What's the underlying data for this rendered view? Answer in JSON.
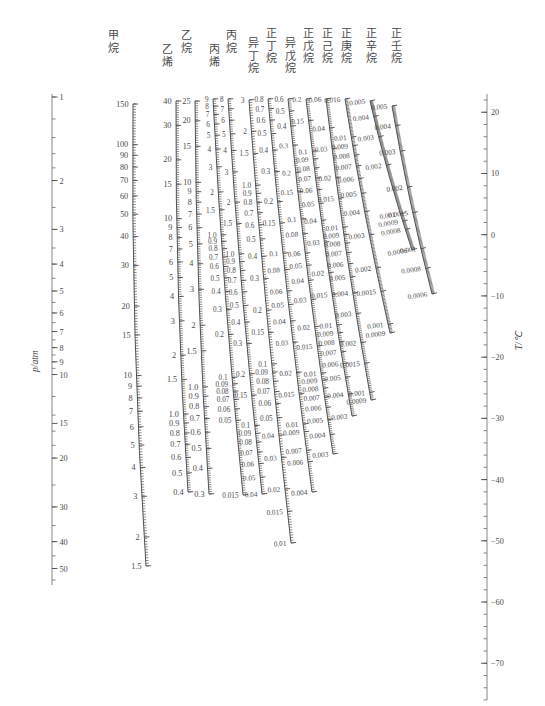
{
  "figure": {
    "kind": "nomogram",
    "left_axis": {
      "label": "p/atm",
      "ticks": [
        "1",
        "2",
        "3",
        "4",
        "5",
        "6",
        "7",
        "8",
        "9",
        "10",
        "15",
        "20",
        "30",
        "40",
        "50"
      ]
    },
    "right_axis": {
      "label": "T/℃",
      "ticks": [
        "20",
        "10",
        "0",
        "−10",
        "−20",
        "−30",
        "−40",
        "−50",
        "−60",
        "−70"
      ]
    }
  },
  "scales": [
    {
      "name": "methane",
      "label": "甲烷",
      "ticks": [
        "150",
        "100",
        "90",
        "80",
        "70",
        "60",
        "50",
        "40",
        "30",
        "20",
        "15",
        "10",
        "9",
        "8",
        "7",
        "6",
        "5",
        "4",
        "3",
        "2",
        "1.5"
      ]
    },
    {
      "name": "ethylene",
      "label": "乙烯",
      "ticks": [
        "40",
        "30",
        "20",
        "15",
        "10",
        "9",
        "8",
        "7",
        "6",
        "5",
        "4",
        "3",
        "2",
        "1.5",
        "1.0",
        "0.9",
        "0.8",
        "0.7",
        "0.6",
        "0.5",
        "0.4"
      ]
    },
    {
      "name": "ethane",
      "label": "乙烷",
      "ticks": [
        "25",
        "20",
        "15",
        "10",
        "9",
        "8",
        "7",
        "6",
        "5",
        "4",
        "3",
        "2",
        "1.5",
        "1.0",
        "0.9",
        "0.8",
        "0.7",
        "0.6",
        "0.5",
        "0.4",
        "0.3"
      ]
    },
    {
      "name": "propylene",
      "label": "丙烯",
      "ticks": [
        "9",
        "8",
        "7",
        "6",
        "5",
        "4",
        "3",
        "2",
        "1.5",
        "1.0",
        "0.9",
        "0.8",
        "0.7",
        "0.6",
        "0.5",
        "0.4",
        "0.3",
        "0.2",
        "0.1",
        "0.09",
        "0.08",
        "0.07",
        "0.06",
        "0.05",
        "0.015"
      ]
    },
    {
      "name": "propane",
      "label": "丙烷",
      "ticks": [
        "8",
        "7",
        "6",
        "5",
        "4",
        "3",
        "2",
        "1.5",
        "1.0",
        "0.9",
        "0.8",
        "0.7",
        "0.6",
        "0.5",
        "0.4",
        "0.3",
        "0.2",
        "0.15",
        "0.1",
        "0.09",
        "0.08",
        "0.07",
        "0.06",
        "0.05",
        "0.04"
      ]
    },
    {
      "name": "isobutane",
      "label": "异丁烷",
      "ticks": [
        "3",
        "2",
        "1.5",
        "1.0",
        "0.9",
        "0.8",
        "0.7",
        "0.6",
        "0.5",
        "0.4",
        "0.3",
        "0.2",
        "0.15",
        "0.1",
        "0.09",
        "0.08",
        "0.07",
        "0.06",
        "0.05",
        "0.04",
        "0.03",
        "0.02",
        "0.015",
        "0.01"
      ]
    },
    {
      "name": "n-butane",
      "label": "正丁烷",
      "ticks": [
        "0.8",
        "0.7",
        "0.6",
        "0.5",
        "0.4",
        "0.3",
        "0.2",
        "0.15",
        "0.1",
        "0.08",
        "0.06",
        "0.05",
        "0.04",
        "0.03",
        "0.02",
        "0.015",
        "0.01",
        "0.009",
        "0.007",
        "0.006",
        "0.004"
      ]
    },
    {
      "name": "isopentane",
      "label": "异戊烷",
      "ticks": [
        "0.6",
        "0.5",
        "0.4",
        "0.3",
        "0.2",
        "0.15",
        "0.1",
        "0.08",
        "0.06",
        "0.05",
        "0.04",
        "0.03",
        "0.02",
        "0.015",
        "0.01",
        "0.009",
        "0.008",
        "0.007",
        "0.006",
        "0.005",
        "0.004",
        "0.003"
      ]
    },
    {
      "name": "n-pentane",
      "label": "正戊烷",
      "ticks": [
        "0.2",
        "0.15",
        "0.1",
        "0.09",
        "0.08",
        "0.07",
        "0.06",
        "0.05",
        "0.04",
        "0.03",
        "0.02",
        "0.015",
        "0.01",
        "0.009",
        "0.008",
        "0.007",
        "0.006",
        "0.005",
        "0.004",
        "0.003"
      ]
    },
    {
      "name": "n-hexane",
      "label": "正己烷",
      "ticks": [
        "0.06",
        "0.04",
        "0.03",
        "0.02",
        "0.015",
        "0.01",
        "0.009",
        "0.008",
        "0.007",
        "0.006",
        "0.005",
        "0.004",
        "0.003",
        "0.002",
        "0.0015",
        "0.001",
        "0.0009"
      ]
    },
    {
      "name": "n-heptane",
      "label": "正庚烷",
      "ticks": [
        "0.016",
        "0.01",
        "0.009",
        "0.008",
        "0.007",
        "0.006",
        "0.005",
        "0.004",
        "0.003",
        "0.002",
        "0.0015",
        "0.001",
        "0.0009"
      ]
    },
    {
      "name": "n-octane",
      "label": "正辛烷",
      "ticks": [
        "0.005",
        "0.004",
        "0.003",
        "0.002",
        "0.001",
        "0.0009",
        "0.0008",
        "0.0006"
      ]
    },
    {
      "name": "n-nonane",
      "label": "正壬烷",
      "ticks": [
        "0.005",
        "0.004",
        "0.003",
        "0.002",
        "0.0015",
        "0.001",
        "0.0008",
        "0.0006"
      ]
    }
  ],
  "chart_data": {
    "type": "line",
    "title": "",
    "xlabel": "",
    "ylabel": "p/atm",
    "grid": false,
    "legend": "top",
    "series": [
      {
        "name": "甲烷 (methane)",
        "top_value": "150",
        "bottom_value": "1.5"
      },
      {
        "name": "乙烯 (ethylene)",
        "top_value": "40",
        "bottom_value": "0.4"
      },
      {
        "name": "乙烷 (ethane)",
        "top_value": "25",
        "bottom_value": "0.3"
      },
      {
        "name": "丙烯 (propylene)",
        "top_value": "9",
        "bottom_value": "0.015"
      },
      {
        "name": "丙烷 (propane)",
        "top_value": "8",
        "bottom_value": "0.04"
      },
      {
        "name": "异丁烷 (isobutane)",
        "top_value": "3",
        "bottom_value": "0.01"
      },
      {
        "name": "正丁烷 (n-butane)",
        "top_value": "0.8",
        "bottom_value": "0.004"
      },
      {
        "name": "异戊烷 (isopentane)",
        "top_value": "0.6",
        "bottom_value": "0.003"
      },
      {
        "name": "正戊烷 (n-pentane)",
        "top_value": "0.2",
        "bottom_value": "0.003"
      },
      {
        "name": "正己烷 (n-hexane)",
        "top_value": "0.06",
        "bottom_value": "0.0009"
      },
      {
        "name": "正庚烷 (n-heptane)",
        "top_value": "0.016",
        "bottom_value": "0.0009"
      },
      {
        "name": "正辛烷 (n-octane)",
        "top_value": "0.005",
        "bottom_value": "0.0006"
      },
      {
        "name": "正壬烷 (n-nonane)",
        "top_value": "0.005",
        "bottom_value": "0.0006"
      }
    ],
    "axes": {
      "left": {
        "label": "p/atm",
        "values": [
          1,
          2,
          3,
          4,
          5,
          6,
          7,
          8,
          9,
          10,
          15,
          20,
          30,
          40,
          50
        ],
        "scale": "log"
      },
      "right": {
        "label": "T/℃",
        "values": [
          20,
          10,
          0,
          -10,
          -20,
          -30,
          -40,
          -50,
          -60,
          -70
        ],
        "scale": "linear",
        "range": [
          -75,
          22
        ]
      }
    }
  }
}
